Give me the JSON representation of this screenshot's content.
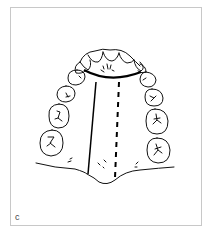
{
  "figure": {
    "panel_label": "c",
    "elements": [
      "incisors",
      "canines",
      "premolars",
      "molars",
      "solid-midline",
      "dashed-midline",
      "anterior-arc-line"
    ]
  }
}
